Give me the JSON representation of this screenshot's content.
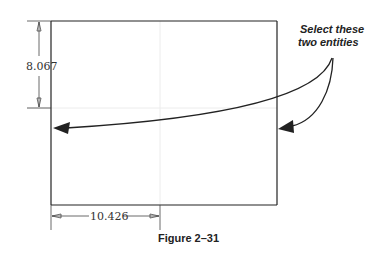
{
  "figure": {
    "caption": "Figure 2–31",
    "dimensions": {
      "vertical": "8.067",
      "horizontal": "10.426"
    },
    "callout": {
      "line1": "Select these",
      "line2": "two entities"
    },
    "colors": {
      "line": "#222222",
      "gridline": "#e6e6e6",
      "dimension": "#444444"
    }
  }
}
